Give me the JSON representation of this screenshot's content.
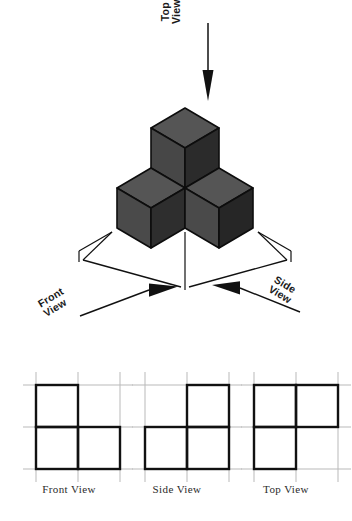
{
  "figure": {
    "type": "isometric-multiview-drawing"
  },
  "direction_arrows": [
    {
      "id": "top",
      "name": "top-view-arrow",
      "label_line1": "Top",
      "label_line2": "View",
      "points": "down"
    },
    {
      "id": "front",
      "name": "front-view-arrow",
      "label_line1": "Front",
      "label_line2": "View",
      "points": "up-right"
    },
    {
      "id": "side",
      "name": "side-view-arrow",
      "label_line1": "Side",
      "label_line2": "View",
      "points": "up-left"
    }
  ],
  "solid": {
    "cube_count": 3,
    "arrangement": "L-shaped triomino: one cube raised at back, two cubes at base",
    "face_colors": {
      "top": "#555555",
      "left": "#474747",
      "right": "#2e2e2e",
      "edge": "#0d0d0d"
    }
  },
  "orthographic_views": [
    {
      "id": "front",
      "label": "Front View",
      "grid": {
        "cols": 2,
        "rows": 2
      },
      "filled_cells": [
        {
          "col": 0,
          "row": 0
        },
        {
          "col": 0,
          "row": 1
        },
        {
          "col": 1,
          "row": 1
        }
      ]
    },
    {
      "id": "side",
      "label": "Side View",
      "grid": {
        "cols": 2,
        "rows": 2
      },
      "filled_cells": [
        {
          "col": 1,
          "row": 0
        },
        {
          "col": 0,
          "row": 1
        },
        {
          "col": 1,
          "row": 1
        }
      ]
    },
    {
      "id": "top",
      "label": "Top View",
      "grid": {
        "cols": 2,
        "rows": 2
      },
      "filled_cells": [
        {
          "col": 0,
          "row": 0
        },
        {
          "col": 1,
          "row": 0
        },
        {
          "col": 0,
          "row": 1
        }
      ]
    }
  ],
  "colors": {
    "background": "#ffffff",
    "ink": "#111111",
    "grid_line": "#b9b9b9",
    "label_text": "#2b2b2b"
  }
}
